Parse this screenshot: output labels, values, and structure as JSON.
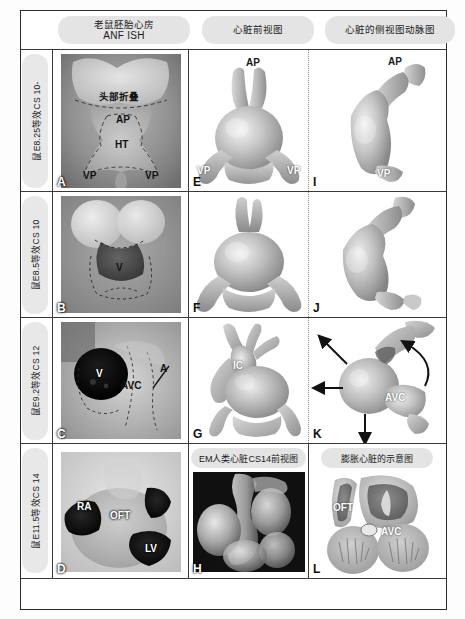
{
  "figure": {
    "columns": [
      {
        "id": "col1",
        "line1": "老鼠胚胎心房",
        "line2": "ANF ISH"
      },
      {
        "id": "col2",
        "line1": "心脏前视图",
        "line2": ""
      },
      {
        "id": "col3",
        "line1": "心脏的侧视图动脉图",
        "line2": ""
      }
    ],
    "rows": [
      {
        "id": "row1",
        "label": "鼠E8.25等效CS 10-"
      },
      {
        "id": "row2",
        "label": "鼠E8.5等效CS 10"
      },
      {
        "id": "row3",
        "label": "鼠E9.2等效CS 12"
      },
      {
        "id": "row4",
        "label": "鼠E11.5等效CS 14"
      }
    ],
    "inner_headers": [
      {
        "id": "panelH_header",
        "text": "EM人类心脏CS14前视图"
      },
      {
        "id": "panelL_header",
        "text": "膨胀心脏的示意图"
      }
    ],
    "panels": [
      {
        "letter": "A",
        "type": "photo",
        "annotations": [
          {
            "text": "头部折叠",
            "style": "dark"
          },
          {
            "text": "AP",
            "style": "dark"
          },
          {
            "text": "HT",
            "style": "dark"
          },
          {
            "text": "VP",
            "style": "dark"
          },
          {
            "text": "VP",
            "style": "dark"
          }
        ]
      },
      {
        "letter": "B",
        "type": "photo",
        "annotations": [
          {
            "text": "V",
            "style": "dark"
          }
        ]
      },
      {
        "letter": "C",
        "type": "photo",
        "annotations": [
          {
            "text": "V",
            "style": "light"
          },
          {
            "text": "AVC",
            "style": "dark"
          },
          {
            "text": "A",
            "style": "dark"
          }
        ]
      },
      {
        "letter": "D",
        "type": "photo",
        "annotations": [
          {
            "text": "RA",
            "style": "light"
          },
          {
            "text": "OFT",
            "style": "light"
          },
          {
            "text": "LV",
            "style": "light"
          }
        ]
      },
      {
        "letter": "E",
        "type": "model",
        "annotations": [
          {
            "text": "AP",
            "style": "dark"
          },
          {
            "text": "VP",
            "style": "light"
          },
          {
            "text": "VP",
            "style": "light"
          }
        ]
      },
      {
        "letter": "F",
        "type": "model",
        "annotations": []
      },
      {
        "letter": "G",
        "type": "model",
        "annotations": [
          {
            "text": "IC",
            "style": "light"
          }
        ]
      },
      {
        "letter": "H",
        "type": "photo",
        "annotations": []
      },
      {
        "letter": "I",
        "type": "model",
        "annotations": [
          {
            "text": "AP",
            "style": "dark"
          },
          {
            "text": "VP",
            "style": "light"
          }
        ]
      },
      {
        "letter": "J",
        "type": "model",
        "annotations": []
      },
      {
        "letter": "K",
        "type": "model",
        "annotations": [
          {
            "text": "AVC",
            "style": "light"
          }
        ]
      },
      {
        "letter": "L",
        "type": "diagram",
        "annotations": [
          {
            "text": "OFT",
            "style": "light"
          },
          {
            "text": "AVC",
            "style": "light"
          }
        ]
      }
    ],
    "colors": {
      "frame": "#2b2b2b",
      "header_pill": "#e4e4e4",
      "row_pill": "#e8e8e8",
      "model_fill": "#b9b9b9",
      "photo_bg": "#8e8e8e"
    }
  }
}
